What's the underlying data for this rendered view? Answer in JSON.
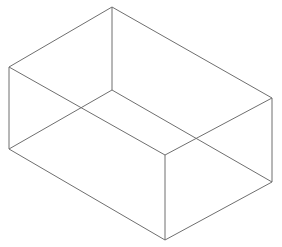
{
  "figure": {
    "name": "wireframe-rectangular-box",
    "title": "Transparent wireframe rectangular box (cuboid) in isometric view",
    "background_color": "#ffffff",
    "line_color": "#6f6f6f",
    "line_width": 1,
    "canvas": {
      "width": 282,
      "height": 247
    },
    "projection": "isometric",
    "vertices": {
      "top_back": {
        "label": "top-back-apex",
        "x": 112,
        "y": 7
      },
      "top_left": {
        "label": "top-left",
        "x": 9,
        "y": 67
      },
      "top_right": {
        "label": "top-right",
        "x": 272,
        "y": 98
      },
      "top_front": {
        "label": "top-front-apex",
        "x": 165,
        "y": 155
      },
      "bottom_back": {
        "label": "bottom-back-apex",
        "x": 112,
        "y": 90
      },
      "bottom_left": {
        "label": "bottom-left",
        "x": 9,
        "y": 149
      },
      "bottom_right": {
        "label": "bottom-right",
        "x": 272,
        "y": 182
      },
      "bottom_front": {
        "label": "bottom-front-apex",
        "x": 165,
        "y": 240
      }
    },
    "edges": [
      {
        "name": "top-back-to-top-left",
        "from": "top_back",
        "to": "top_left"
      },
      {
        "name": "top-back-to-top-right",
        "from": "top_back",
        "to": "top_right"
      },
      {
        "name": "top-left-to-top-front",
        "from": "top_left",
        "to": "top_front"
      },
      {
        "name": "top-right-to-top-front",
        "from": "top_right",
        "to": "top_front"
      },
      {
        "name": "bottom-back-to-bottom-left",
        "from": "bottom_back",
        "to": "bottom_left"
      },
      {
        "name": "bottom-back-to-bottom-right",
        "from": "bottom_back",
        "to": "bottom_right"
      },
      {
        "name": "bottom-left-to-bottom-front",
        "from": "bottom_left",
        "to": "bottom_front"
      },
      {
        "name": "bottom-right-to-bottom-front",
        "from": "bottom_right",
        "to": "bottom_front"
      },
      {
        "name": "vertical-back",
        "from": "top_back",
        "to": "bottom_back"
      },
      {
        "name": "vertical-left",
        "from": "top_left",
        "to": "bottom_left"
      },
      {
        "name": "vertical-right",
        "from": "top_right",
        "to": "bottom_right"
      },
      {
        "name": "vertical-front",
        "from": "top_front",
        "to": "bottom_front"
      }
    ],
    "edge_crossings": [
      {
        "name": "left-crossing",
        "x": 81,
        "y": 111
      },
      {
        "name": "right-crossing",
        "x": 199,
        "y": 135
      }
    ]
  }
}
